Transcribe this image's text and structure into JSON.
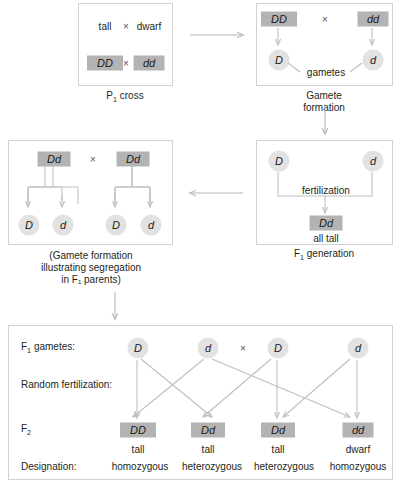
{
  "figure": {
    "colors": {
      "genotype_box": "#b3b3b3",
      "gamete_circle": "#e2e2e2",
      "panel_border": "#d2d2d2",
      "arrow": "#b8b8b8",
      "text": "#231f20"
    }
  },
  "panel_p1": {
    "caption": "P₁ cross",
    "phenotype_left": "tall",
    "cross_symbol": "×",
    "phenotype_right": "dwarf",
    "genotype_left": "DD",
    "genotype_right": "dd"
  },
  "panel_gamete_formation": {
    "caption": "Gamete formation",
    "parent_left": "DD",
    "cross_symbol": "×",
    "parent_right": "dd",
    "gamete_left": "D",
    "gamete_right": "d",
    "gametes_label": "gametes"
  },
  "panel_f1": {
    "caption": "F₁ generation",
    "gamete_left": "D",
    "gamete_right": "d",
    "fertilization_label": "fertilization",
    "offspring_genotype": "Dd",
    "offspring_phenotype": "all tall"
  },
  "panel_f1_gamete_formation": {
    "caption": "(Gamete formation\nillustrating segregation\nin F₁ parents)",
    "parent_left": "Dd",
    "cross_symbol": "×",
    "parent_right": "Dd",
    "gametes": [
      "D",
      "d",
      "D",
      "d"
    ]
  },
  "panel_f2": {
    "row_labels": {
      "gametes": "F₁ gametes:",
      "fertilization": "Random fertilization:",
      "f2": "F₂",
      "designation": "Designation:"
    },
    "cross_symbol": "×",
    "gametes": [
      "D",
      "d",
      "D",
      "d"
    ],
    "offspring": [
      {
        "genotype": "DD",
        "phenotype": "tall",
        "designation": "homozygous"
      },
      {
        "genotype": "Dd",
        "phenotype": "tall",
        "designation": "heterozygous"
      },
      {
        "genotype": "Dd",
        "phenotype": "tall",
        "designation": "heterozygous"
      },
      {
        "genotype": "dd",
        "phenotype": "dwarf",
        "designation": "homozygous"
      }
    ]
  }
}
